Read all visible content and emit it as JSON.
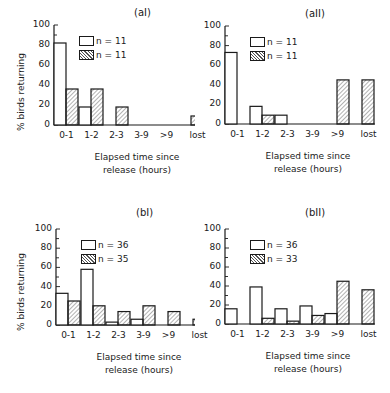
{
  "chart_data": [
    {
      "type": "bar",
      "title": "(aI)",
      "xlabel": "Elapsed time since release (hours)",
      "ylabel": "% birds returning",
      "ylim": [
        0,
        100
      ],
      "yticks": [
        "0",
        "20",
        "40",
        "60",
        "80",
        "100"
      ],
      "categories": [
        "0-1",
        "1-2",
        "2-3",
        "3-9",
        ">9",
        "lost"
      ],
      "series": [
        {
          "name": "n = 11",
          "style": "open",
          "values": [
            82,
            18,
            0,
            0,
            0,
            0
          ]
        },
        {
          "name": "n = 11",
          "style": "hatched",
          "values": [
            36,
            36,
            18,
            0,
            0,
            9
          ]
        }
      ]
    },
    {
      "type": "bar",
      "title": "(aII)",
      "xlabel": "Elapsed time since release (hours)",
      "ylabel": "",
      "ylim": [
        0,
        100
      ],
      "yticks": [
        "0",
        "20",
        "40",
        "60",
        "80",
        "100"
      ],
      "categories": [
        "0-1",
        "1-2",
        "2-3",
        "3-9",
        ">9",
        "lost"
      ],
      "series": [
        {
          "name": "n = 11",
          "style": "open",
          "values": [
            73,
            18,
            9,
            0,
            0,
            0
          ]
        },
        {
          "name": "n = 11",
          "style": "hatched",
          "values": [
            0,
            9,
            0,
            0,
            45,
            45
          ]
        }
      ]
    },
    {
      "type": "bar",
      "title": "(bI)",
      "xlabel": "Elapsed time since release (hours)",
      "ylabel": "% birds returning",
      "ylim": [
        0,
        100
      ],
      "yticks": [
        "0",
        "20",
        "40",
        "60",
        "80",
        "100"
      ],
      "categories": [
        "0-1",
        "1-2",
        "2-3",
        "3-9",
        ">9",
        "lost"
      ],
      "series": [
        {
          "name": "n = 36",
          "style": "open",
          "values": [
            33,
            58,
            3,
            6,
            0,
            0
          ]
        },
        {
          "name": "n = 35",
          "style": "hatched",
          "values": [
            25,
            20,
            14,
            20,
            14,
            6
          ]
        }
      ]
    },
    {
      "type": "bar",
      "title": "(bII)",
      "xlabel": "Elapsed time since release (hours)",
      "ylabel": "",
      "ylim": [
        0,
        100
      ],
      "yticks": [
        "0",
        "20",
        "40",
        "60",
        "80",
        "100"
      ],
      "categories": [
        "0-1",
        "1-2",
        "2-3",
        "3-9",
        ">9",
        "lost"
      ],
      "series": [
        {
          "name": "n = 36",
          "style": "open",
          "values": [
            16,
            39,
            16,
            19,
            11,
            0
          ]
        },
        {
          "name": "n = 33",
          "style": "hatched",
          "values": [
            0,
            6,
            3,
            9,
            45,
            36
          ]
        }
      ]
    }
  ],
  "panels": [
    {
      "title": "(aI)",
      "ylabel": "% birds returning",
      "legend": [
        "n = 11",
        "n = 11"
      ],
      "xlabel_1": "Elapsed time since",
      "xlabel_2": "release (hours)"
    },
    {
      "title": "(aII)",
      "ylabel": "",
      "legend": [
        "n = 11",
        "n = 11"
      ],
      "xlabel_1": "Elapsed time since",
      "xlabel_2": "release (hours)"
    },
    {
      "title": "(bI)",
      "ylabel": "% birds returning",
      "legend": [
        "n = 36",
        "n = 35"
      ],
      "xlabel_1": "Elapsed time since",
      "xlabel_2": "release (hours)"
    },
    {
      "title": "(bII)",
      "ylabel": "",
      "legend": [
        "n = 36",
        "n = 33"
      ],
      "xlabel_1": "Elapsed time since",
      "xlabel_2": "release (hours)"
    }
  ],
  "categories": [
    "0-1",
    "1-2",
    "2-3",
    "3-9",
    ">9",
    "lost"
  ],
  "yticks": [
    "0",
    "20",
    "40",
    "60",
    "80",
    "100"
  ]
}
